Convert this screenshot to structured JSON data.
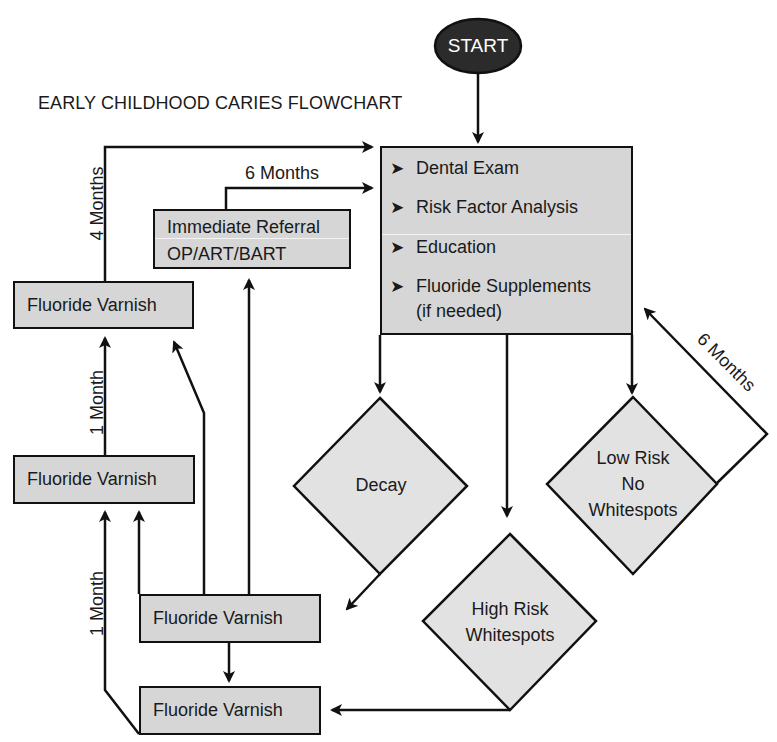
{
  "title": "EARLY CHILDHOOD CARIES FLOWCHART",
  "start": {
    "label": "START",
    "fill": "#2b2b2b"
  },
  "colors": {
    "box_fill": "#d6d6d6",
    "diamond_fill": "#e2e2e2",
    "stroke": "#111111"
  },
  "main_box": {
    "items": [
      {
        "bullet": "➤",
        "label": "Dental Exam"
      },
      {
        "bullet": "➤",
        "label": "Risk Factor Analysis"
      },
      {
        "bullet": "➤",
        "label": "Education"
      },
      {
        "bullet": "➤",
        "label": "Fluoride Supplements"
      }
    ],
    "continuation": "(if needed)"
  },
  "referral_box": {
    "line1": "Immediate Referral",
    "line2": "OP/ART/BART"
  },
  "fluoride_boxes": [
    {
      "label": "Fluoride Varnish"
    },
    {
      "label": "Fluoride Varnish"
    },
    {
      "label": "Fluoride Varnish"
    },
    {
      "label": "Fluoride Varnish"
    }
  ],
  "diamonds": {
    "decay": {
      "label": "Decay"
    },
    "high_risk": {
      "line1": "High Risk",
      "line2": "Whitespots"
    },
    "low_risk": {
      "line1": "Low Risk",
      "line2": "No",
      "line3": "Whitespots"
    }
  },
  "interval_labels": {
    "four_months": "4 Months",
    "six_months_referral": "6 Months",
    "six_months_low_risk": "6 Months",
    "one_month_upper": "1 Month",
    "one_month_lower": "1 Month"
  }
}
